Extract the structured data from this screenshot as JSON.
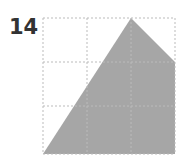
{
  "problem": {
    "number": "14"
  },
  "figure": {
    "grid": {
      "rows": 3,
      "cols": 3,
      "left": 43,
      "top": 18,
      "cell": 44,
      "line_color": "#bbbbbb"
    },
    "shape": {
      "fill": "#a6a6a6",
      "points": "43,154 131,18 175,62 175,154"
    }
  }
}
